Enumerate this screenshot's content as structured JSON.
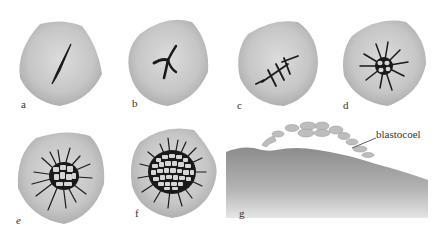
{
  "figure": {
    "panels": [
      {
        "id": "a",
        "label": "a",
        "stage": "single cleavage furrow"
      },
      {
        "id": "b",
        "label": "b",
        "stage": "branched furrow"
      },
      {
        "id": "c",
        "label": "c",
        "stage": "multiple furrows"
      },
      {
        "id": "d",
        "label": "d",
        "stage": "radiating furrows with small cells"
      },
      {
        "id": "e",
        "label": "e",
        "stage": "cell cluster with radiating furrows"
      },
      {
        "id": "f",
        "label": "f",
        "stage": "larger blastodisc cell cluster"
      },
      {
        "id": "g",
        "label": "g",
        "stage": "side section"
      }
    ],
    "annotations": [
      {
        "panel": "g",
        "text": "blastocoel"
      }
    ],
    "colors": {
      "egg_fill": "#c4c4c4",
      "egg_highlight": "#d9d9d9",
      "egg_edge": "#a9a9a9",
      "furrow": "#1a1a1a",
      "cell_fill": "#d6d6d6",
      "background": "#ffffff"
    }
  }
}
